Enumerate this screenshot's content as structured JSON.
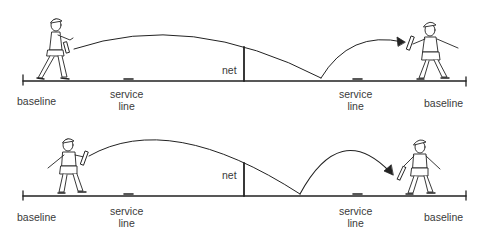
{
  "diagrams": [
    {
      "id": "top",
      "labels": {
        "baseline_left": "baseline",
        "service_line_left": "service\nline",
        "net": "net",
        "service_line_right": "service\nline",
        "baseline_right": "baseline"
      },
      "description": "Player at left baseline hits ball over net; ball bounces past the net in the far court and is caught by player at right baseline"
    },
    {
      "id": "bottom",
      "labels": {
        "baseline_left": "baseline",
        "service_line_left": "service\nline",
        "net": "net",
        "service_line_right": "service\nline",
        "baseline_right": "baseline"
      },
      "description": "Player near left baseline hits ball over net; ball bounces closer to the net and arrives at player standing inside the right baseline"
    }
  ],
  "colors": {
    "line": "#222222",
    "text": "#3a3a3a",
    "background": "#ffffff"
  }
}
